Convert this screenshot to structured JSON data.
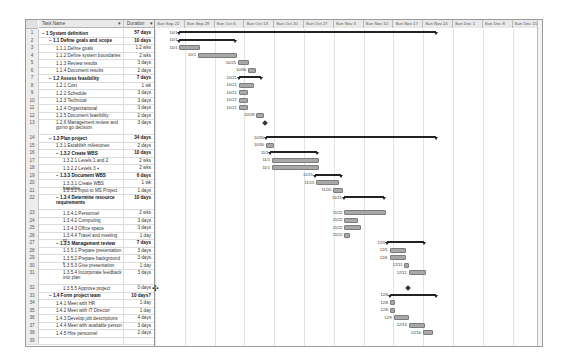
{
  "columns": {
    "task_name": "Task Name",
    "duration": "Duration"
  },
  "timeline": {
    "weeks": [
      "Sun Sep 22",
      "Sun Sep 29",
      "Sun Oct 6",
      "Sun Oct 13",
      "Sun Oct 20",
      "Sun Oct 27",
      "Sun Nov 3",
      "Sun Nov 10",
      "Sun Nov 17",
      "Sun Nov 24",
      "Sun Dec 1",
      "Sun Dec 8",
      "Sun Dec 15"
    ]
  },
  "tasks": [
    {
      "id": "1",
      "name": "− 1 System definition",
      "duration": "57 days",
      "summary": true,
      "indent": 0
    },
    {
      "id": "2",
      "name": "− 1.1 Define goals and scope",
      "duration": "10 days",
      "summary": true,
      "indent": 1
    },
    {
      "id": "3",
      "name": "1.1.1 Define goals",
      "duration": "1.2 wks",
      "indent": 2
    },
    {
      "id": "4",
      "name": "1.1.2 Define system boundaries",
      "duration": "2 wks",
      "indent": 2
    },
    {
      "id": "5",
      "name": "1.1.3 Review results",
      "duration": "3 days",
      "indent": 2
    },
    {
      "id": "6",
      "name": "1.1.4 Document results",
      "duration": "2 days",
      "indent": 2
    },
    {
      "id": "7",
      "name": "− 1.2 Assess feasibility",
      "duration": "7 days",
      "summary": true,
      "indent": 1
    },
    {
      "id": "8",
      "name": "1.2.1 Cost",
      "duration": "1 wk",
      "indent": 2
    },
    {
      "id": "9",
      "name": "1.2.2 Schedule",
      "duration": "3 days",
      "indent": 2
    },
    {
      "id": "10",
      "name": "1.2.3 Technical",
      "duration": "3 days",
      "indent": 2
    },
    {
      "id": "11",
      "name": "1.2.4 Organizational",
      "duration": "3 days",
      "indent": 2
    },
    {
      "id": "12",
      "name": "1.2.5 Document feasibility",
      "duration": "2 days",
      "indent": 2
    },
    {
      "id": "13",
      "name": "1.2.6 Management review and go/no go decision",
      "duration": "3 days",
      "indent": 2,
      "tall": true
    },
    {
      "id": "14",
      "name": "− 1.3 Plan project",
      "duration": "34 days",
      "summary": true,
      "indent": 1
    },
    {
      "id": "15",
      "name": "1.3.1 Establish milestones",
      "duration": "2 days",
      "indent": 2
    },
    {
      "id": "16",
      "name": "− 1.3.2 Create WBS",
      "duration": "10 days",
      "summary": true,
      "indent": 2
    },
    {
      "id": "17",
      "name": "1.3.2.1 Levels 1 and 2",
      "duration": "2 wks",
      "indent": 3
    },
    {
      "id": "18",
      "name": "1.3.2.2 Levels 3 +",
      "duration": "2 wks",
      "indent": 3
    },
    {
      "id": "19",
      "name": "− 1.3.3 Document WBS",
      "duration": "6 days",
      "summary": true,
      "indent": 2
    },
    {
      "id": "20",
      "name": "1.3.3.1 Create WBS baseline",
      "duration": "1 wk",
      "indent": 3
    },
    {
      "id": "21",
      "name": "1.3.3.2 Input to MS Project",
      "duration": "1 days",
      "indent": 3
    },
    {
      "id": "22",
      "name": "− 1.3.4 Determine resource requirements",
      "duration": "10 days",
      "summary": true,
      "indent": 2,
      "tall": true
    },
    {
      "id": "23",
      "name": "1.3.4.1 Personnel",
      "duration": "2 wks",
      "indent": 3
    },
    {
      "id": "24",
      "name": "1.3.4.2 Computing",
      "duration": "3 days",
      "indent": 3
    },
    {
      "id": "25",
      "name": "1.3.4.3 Office space",
      "duration": "3 days",
      "indent": 3
    },
    {
      "id": "26",
      "name": "1.3.4.4 Travel and meeting ro",
      "duration": "1 day",
      "indent": 3
    },
    {
      "id": "27",
      "name": "− 1.3.5 Management review",
      "duration": "7 days",
      "summary": true,
      "indent": 2
    },
    {
      "id": "28",
      "name": "1.3.5.1 Prepare presentation",
      "duration": "3 days",
      "indent": 3
    },
    {
      "id": "29",
      "name": "1.3.5.2 Prepare background r",
      "duration": "3 days",
      "indent": 3
    },
    {
      "id": "30",
      "name": "1.3.5.3 Give presentation",
      "duration": "1 day",
      "indent": 3
    },
    {
      "id": "31",
      "name": "1.3.5.4 Incorporate feedback into plan",
      "duration": "3 days",
      "indent": 3,
      "tall": true
    },
    {
      "id": "32",
      "name": "1.3.5.5 Approve project",
      "duration": "0 days",
      "indent": 3
    },
    {
      "id": "33",
      "name": "− 1.4 Form project team",
      "duration": "10 days?",
      "summary": true,
      "indent": 1
    },
    {
      "id": "34",
      "name": "1.4.1 Meet with HR",
      "duration": "1 day",
      "indent": 2
    },
    {
      "id": "35",
      "name": "1.4.2 Meet with IT Director",
      "duration": "1 day",
      "indent": 2
    },
    {
      "id": "36",
      "name": "1.4.3 Develop job descriptions",
      "duration": "4 days",
      "indent": 2
    },
    {
      "id": "37",
      "name": "1.4.4 Meet with available person",
      "duration": "3 days",
      "indent": 2
    },
    {
      "id": "38",
      "name": "1.4.5 Hire personnel",
      "duration": "2 days",
      "indent": 2
    },
    {
      "id": "39",
      "name": "",
      "duration": "",
      "indent": 0
    }
  ],
  "bars": [
    {
      "row": "1",
      "type": "summary",
      "label": "10/1",
      "start": 33,
      "end": 380
    },
    {
      "row": "2",
      "type": "summary",
      "label": "10/1",
      "start": 33,
      "end": 108
    },
    {
      "row": "3",
      "type": "task",
      "label": "10/1",
      "start": 33,
      "end": 58
    },
    {
      "row": "4",
      "type": "task",
      "label": "10/1",
      "start": 58,
      "end": 108
    },
    {
      "row": "5",
      "type": "task",
      "label": "10/25",
      "start": 112,
      "end": 125
    },
    {
      "row": "6",
      "type": "task",
      "label": "10/30",
      "start": 126,
      "end": 134
    },
    {
      "row": "7",
      "type": "summary",
      "label": "10/21",
      "start": 113,
      "end": 143
    },
    {
      "row": "8",
      "type": "task",
      "label": "10/21",
      "start": 113,
      "end": 131
    },
    {
      "row": "9",
      "type": "task",
      "label": "10/21",
      "start": 113,
      "end": 123
    },
    {
      "row": "10",
      "type": "task",
      "label": "10/21",
      "start": 113,
      "end": 123
    },
    {
      "row": "11",
      "type": "task",
      "label": "10/21",
      "start": 113,
      "end": 123
    },
    {
      "row": "12",
      "type": "task",
      "label": "10/28",
      "start": 137,
      "end": 145
    },
    {
      "row": "13",
      "type": "milestone",
      "label": "",
      "start": 149,
      "end": 149
    },
    {
      "row": "14",
      "type": "summary",
      "label": "10/30",
      "start": 150,
      "end": 380
    },
    {
      "row": "15",
      "type": "task",
      "label": "10/30",
      "start": 150,
      "end": 158
    },
    {
      "row": "16",
      "type": "summary",
      "label": "11/1",
      "start": 156,
      "end": 219
    },
    {
      "row": "17",
      "type": "task",
      "label": "11/1",
      "start": 158,
      "end": 219
    },
    {
      "row": "18",
      "type": "task",
      "label": "11/1",
      "start": 158,
      "end": 219
    },
    {
      "row": "19",
      "type": "summary",
      "label": "11/15",
      "start": 216,
      "end": 252
    },
    {
      "row": "20",
      "type": "task",
      "label": "11/15",
      "start": 218,
      "end": 246
    },
    {
      "row": "21",
      "type": "task",
      "label": "11/20",
      "start": 241,
      "end": 252
    },
    {
      "row": "22",
      "type": "summary",
      "label": "11/21",
      "start": 255,
      "end": 310
    },
    {
      "row": "23",
      "type": "task",
      "label": "11/22",
      "start": 256,
      "end": 310
    },
    {
      "row": "24",
      "type": "task",
      "label": "11/22",
      "start": 256,
      "end": 272
    },
    {
      "row": "25",
      "type": "task",
      "label": "11/22",
      "start": 256,
      "end": 276
    },
    {
      "row": "26",
      "type": "task",
      "label": "11/22",
      "start": 256,
      "end": 261
    },
    {
      "row": "27",
      "type": "summary",
      "label": "12/5",
      "start": 314,
      "end": 364
    },
    {
      "row": "28",
      "type": "task",
      "label": "12/5",
      "start": 317,
      "end": 337
    },
    {
      "row": "29",
      "type": "task",
      "label": "12/6",
      "start": 317,
      "end": 337
    },
    {
      "row": "30",
      "type": "task",
      "label": "12/11",
      "start": 337,
      "end": 341
    },
    {
      "row": "31",
      "type": "task",
      "label": "12/12",
      "start": 343,
      "end": 364
    },
    {
      "row": "32",
      "type": "milestone",
      "label": "",
      "start": 342,
      "end": 342
    },
    {
      "row": "33",
      "type": "summary",
      "label": "12/6",
      "start": 318,
      "end": 380
    },
    {
      "row": "34",
      "type": "task",
      "label": "12/6",
      "start": 318,
      "end": 322
    },
    {
      "row": "35",
      "type": "task",
      "label": "12/6",
      "start": 318,
      "end": 322
    },
    {
      "row": "36",
      "type": "task",
      "label": "12/9",
      "start": 323,
      "end": 340
    },
    {
      "row": "37",
      "type": "task",
      "label": "12/13",
      "start": 343,
      "end": 362
    },
    {
      "row": "38",
      "type": "task",
      "label": "12/16",
      "start": 362,
      "end": 373
    }
  ]
}
